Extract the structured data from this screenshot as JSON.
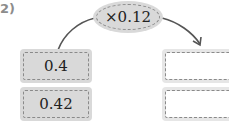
{
  "problem_number": "2)",
  "operator": {
    "label": "×0.12"
  },
  "inputs": [
    {
      "value": "0.4"
    },
    {
      "value": "0.42"
    }
  ],
  "outputs": [
    {
      "value": ""
    },
    {
      "value": ""
    }
  ],
  "colors": {
    "box_fill": "#d9d9d9",
    "dash": "#8a8a8a",
    "arrow": "#555555",
    "label": "#8c8c8c"
  }
}
